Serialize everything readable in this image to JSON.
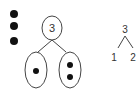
{
  "diagram": {
    "counters": {
      "count": 3,
      "color": "#111111"
    },
    "pictorial_bond": {
      "whole": "3",
      "parts": [
        {
          "label": "part-1",
          "dots": 1
        },
        {
          "label": "part-2",
          "dots": 2
        }
      ]
    },
    "numeric_bond": {
      "whole": "3",
      "parts": [
        "1",
        "2"
      ]
    },
    "colors": {
      "stroke": "#444444",
      "dot": "#111111",
      "background": "#ffffff"
    }
  }
}
